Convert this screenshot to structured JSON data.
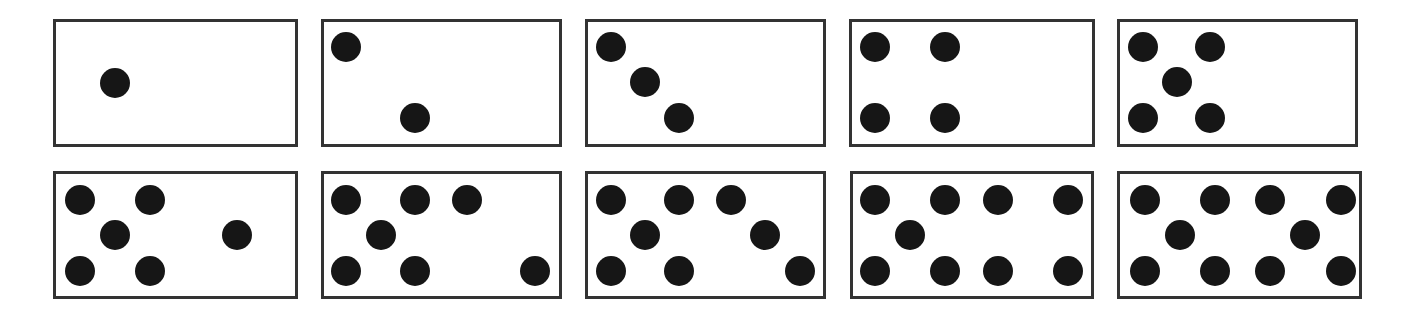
{
  "colors": {
    "border": "#333333",
    "dot": "#161616",
    "background": "#ffffff"
  },
  "dot_diameter": 30,
  "cards": [
    {
      "count": 1,
      "box": [
        53,
        19,
        245,
        128
      ],
      "dots": [
        [
          115,
          83
        ]
      ]
    },
    {
      "count": 2,
      "box": [
        321,
        19,
        241,
        128
      ],
      "dots": [
        [
          346,
          47
        ],
        [
          415,
          118
        ]
      ]
    },
    {
      "count": 3,
      "box": [
        585,
        19,
        241,
        128
      ],
      "dots": [
        [
          611,
          47
        ],
        [
          645,
          82
        ],
        [
          679,
          118
        ]
      ]
    },
    {
      "count": 4,
      "box": [
        849,
        19,
        246,
        128
      ],
      "dots": [
        [
          875,
          47
        ],
        [
          945,
          47
        ],
        [
          875,
          118
        ],
        [
          945,
          118
        ]
      ]
    },
    {
      "count": 5,
      "box": [
        1117,
        19,
        241,
        128
      ],
      "dots": [
        [
          1143,
          47
        ],
        [
          1210,
          47
        ],
        [
          1177,
          82
        ],
        [
          1143,
          118
        ],
        [
          1210,
          118
        ]
      ]
    },
    {
      "count": 6,
      "box": [
        53,
        171,
        245,
        128
      ],
      "dots": [
        [
          80,
          200
        ],
        [
          150,
          200
        ],
        [
          115,
          235
        ],
        [
          237,
          235
        ],
        [
          80,
          271
        ],
        [
          150,
          271
        ]
      ]
    },
    {
      "count": 7,
      "box": [
        321,
        171,
        241,
        128
      ],
      "dots": [
        [
          346,
          200
        ],
        [
          415,
          200
        ],
        [
          467,
          200
        ],
        [
          381,
          235
        ],
        [
          346,
          271
        ],
        [
          415,
          271
        ],
        [
          535,
          271
        ]
      ]
    },
    {
      "count": 8,
      "box": [
        585,
        171,
        241,
        128
      ],
      "dots": [
        [
          611,
          200
        ],
        [
          679,
          200
        ],
        [
          731,
          200
        ],
        [
          645,
          235
        ],
        [
          765,
          235
        ],
        [
          611,
          271
        ],
        [
          679,
          271
        ],
        [
          800,
          271
        ]
      ]
    },
    {
      "count": 9,
      "box": [
        850,
        171,
        244,
        128
      ],
      "dots": [
        [
          875,
          200
        ],
        [
          945,
          200
        ],
        [
          998,
          200
        ],
        [
          1068,
          200
        ],
        [
          910,
          235
        ],
        [
          875,
          271
        ],
        [
          945,
          271
        ],
        [
          998,
          271
        ],
        [
          1068,
          271
        ]
      ]
    },
    {
      "count": 10,
      "box": [
        1117,
        171,
        245,
        128
      ],
      "dots": [
        [
          1145,
          200
        ],
        [
          1215,
          200
        ],
        [
          1270,
          200
        ],
        [
          1341,
          200
        ],
        [
          1180,
          235
        ],
        [
          1305,
          235
        ],
        [
          1145,
          271
        ],
        [
          1215,
          271
        ],
        [
          1270,
          271
        ],
        [
          1341,
          271
        ]
      ]
    }
  ]
}
